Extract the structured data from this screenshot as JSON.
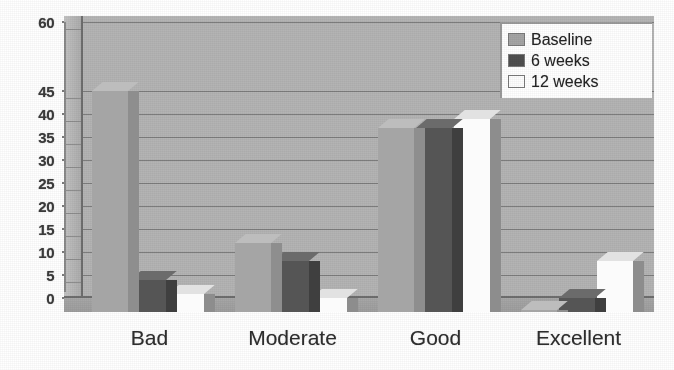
{
  "chart_data": {
    "type": "bar",
    "title": "",
    "subtitle": "",
    "xlabel": "",
    "ylabel": "",
    "categories": [
      "Bad",
      "Moderate",
      "Good",
      "Excellent"
    ],
    "series": [
      {
        "name": "Baseline",
        "color": "#a5a5a5",
        "values": [
          48,
          15,
          40,
          0.5
        ]
      },
      {
        "name": "6 weeks",
        "color": "#4f4f4f",
        "values": [
          7,
          11,
          40,
          3
        ]
      },
      {
        "name": "12 weeks",
        "color": "#fdfdfd",
        "values": [
          4,
          3,
          42,
          11
        ]
      }
    ],
    "ylim": [
      0,
      60
    ],
    "yticks": [
      0,
      5,
      10,
      15,
      20,
      25,
      30,
      35,
      40,
      45,
      60
    ],
    "ytick_labels": [
      "0",
      "5",
      "10",
      "15",
      "20",
      "25",
      "30",
      "35",
      "40",
      "45",
      "60"
    ],
    "grid": true,
    "grid_axis": "y",
    "legend_position": "top-right",
    "style": "3d-column-grayscale",
    "annotations": []
  },
  "legend": {
    "items": [
      {
        "label": "Baseline",
        "swatch": "legend-swatch-baseline"
      },
      {
        "label": "6 weeks",
        "swatch": "legend-swatch-6-weeks"
      },
      {
        "label": "12 weeks",
        "swatch": "legend-swatch-12-weeks"
      }
    ]
  },
  "colors": {
    "baseline": "#a5a5a5",
    "six_weeks": "#4f4f4f",
    "twelve_weeks": "#fdfdfd",
    "plot_background": "#b4b4b4",
    "gridline": "#7d7d7d",
    "axis": "#6e6e6e",
    "text": "#2e2e2e"
  }
}
